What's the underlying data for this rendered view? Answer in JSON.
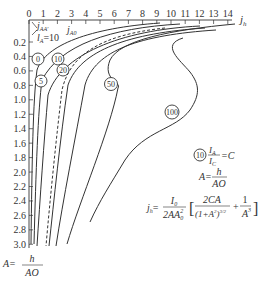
{
  "chart_data": {
    "type": "line",
    "title": "",
    "xlabel": "j_h",
    "ylabel": "A = h / AO",
    "x_axis_position": "top",
    "y_axis_inverted": true,
    "xlim": [
      0,
      14
    ],
    "ylim": [
      3.0,
      0.0
    ],
    "x_ticks": [
      "0",
      "1",
      "2",
      "3",
      "4",
      "5",
      "6",
      "7",
      "8",
      "9",
      "10",
      "11",
      "12",
      "13",
      "14"
    ],
    "y_ticks": [
      "0.2",
      "0.4",
      "0.6",
      "0.8",
      "1.0",
      "1.2",
      "1.4",
      "1.6",
      "1.8",
      "2.0",
      "2.2",
      "2.4",
      "2.6",
      "2.8",
      "3.0"
    ],
    "series": [
      {
        "name": "C = 0",
        "label": "0"
      },
      {
        "name": "C = 5",
        "label": "5"
      },
      {
        "name": "C = 10",
        "label": "10",
        "style": "dashed"
      },
      {
        "name": "C = 20",
        "label": "20"
      },
      {
        "name": "C = 50",
        "label": "50"
      },
      {
        "name": "C = 100",
        "label": "100"
      }
    ],
    "annotations": [
      "j_AA'",
      "l_A = 10",
      "j_A0",
      "(10) I_A / I_C = C",
      "A = h / AO",
      "j_h = I_0 / (2 A A_0^2) [ 2CA / (1+A^2)^(3/2) + 1 / A^3 ]"
    ]
  },
  "axis": {
    "x_title": "j",
    "x_title_sub": "h",
    "y_title_prefix": "A=",
    "y_title_num": "h",
    "y_title_den": "AO"
  },
  "annotations": {
    "top_left_1_main": "j",
    "top_left_1_sub": "AA'",
    "top_left_2_main": "l",
    "top_left_2_sub": "A",
    "top_left_2_val": "=10",
    "top_mid_main": "j",
    "top_mid_sub": "A0"
  },
  "legend": {
    "badge": "10",
    "ratio_num": "I",
    "ratio_num_sub": "A",
    "ratio_den": "I",
    "ratio_den_sub": "C",
    "ratio_eq": "=C",
    "a_prefix": "A=",
    "a_num": "h",
    "a_den": "AO"
  },
  "formula": {
    "lhs": "j",
    "lhs_sub": "h",
    "eq": "=",
    "frac_num": "I",
    "frac_num_sub": "0",
    "frac_den": "2AA",
    "frac_den_sub": "0",
    "frac_den_sup": "2",
    "term1_num": "2CA",
    "term1_den": "(1+A",
    "term1_den_sup": "2",
    "term1_den_close": ")",
    "term1_den_pow": "3/2",
    "plus": "+",
    "term2_num": "1",
    "term2_den": "A",
    "term2_den_sup": "3"
  }
}
